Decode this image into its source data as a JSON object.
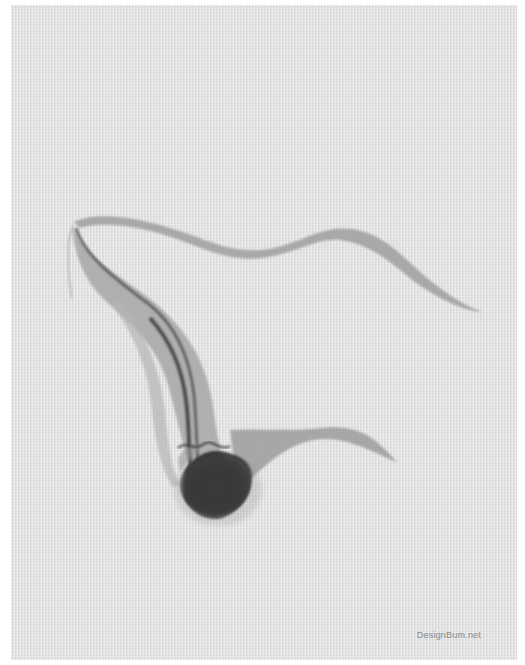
{
  "artwork": {
    "description": "Abstract grey ink/smoke wisp on textured light-grey paper",
    "colors": {
      "border": "#ffffff",
      "paper": "#e3e3e3",
      "ink_light": "#a9a9a9",
      "ink_mid": "#7d7d7d",
      "ink_dark": "#1e1e1e"
    }
  },
  "watermark": {
    "text": "DesignBum.net"
  }
}
